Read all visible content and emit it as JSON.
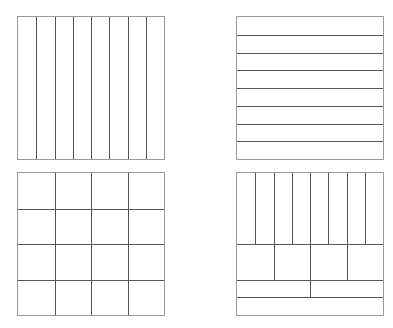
{
  "figure": {
    "line_color": "#555555",
    "border_color": "#9a9a9a",
    "panels": [
      {
        "id": "top-left",
        "partition": "8 vertical strips (eighths)",
        "x": 17,
        "y": 16,
        "cols": 8,
        "rows": 1
      },
      {
        "id": "top-right",
        "partition": "8 horizontal strips (eighths)",
        "x": 236,
        "y": 16,
        "cols": 1,
        "rows": 8
      },
      {
        "id": "bottom-left",
        "partition": "4x4 grid (sixteenths)",
        "x": 17,
        "y": 172,
        "cols": 4,
        "rows": 4
      },
      {
        "id": "bottom-right",
        "partition": "mixed: 8 sixteenths, 4 sixteenths-pairs, 2 sixteenths, 1 eighth",
        "x": 236,
        "y": 172,
        "bands": [
          {
            "height_fraction": 0.5,
            "cells": 8
          },
          {
            "height_fraction": 0.25,
            "cells": 4
          },
          {
            "height_fraction": 0.125,
            "cells": 2
          },
          {
            "height_fraction": 0.125,
            "cells": 1
          }
        ]
      }
    ]
  }
}
